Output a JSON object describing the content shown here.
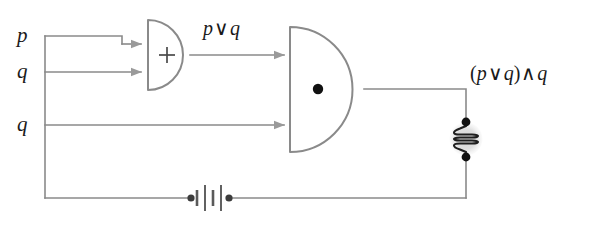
{
  "diagram": {
    "background_color": "#ffffff",
    "wire_color": "#8a8a8a",
    "gate_stroke_color": "#8a8a8a",
    "symbol_color": "#4a4a4a",
    "battery_color": "#5a5a5a",
    "lamp_halo_color": "#d8d8d8",
    "terminal_dot_color": "#111111",
    "text_color": "#1a1a1a"
  },
  "inputs": [
    {
      "id": "input-p",
      "label": "p",
      "y": 36
    },
    {
      "id": "input-q1",
      "label": "q",
      "y": 72
    },
    {
      "id": "input-q2",
      "label": "q",
      "y": 125
    }
  ],
  "gates": [
    {
      "id": "or-gate",
      "type": "OR",
      "symbol": "+",
      "symbol_name": "plus-symbol",
      "output_label": "p ∨ q"
    },
    {
      "id": "and-gate",
      "type": "AND",
      "symbol": "•",
      "symbol_name": "dot-symbol",
      "output_label": "(p ∨ q) ∧ q"
    }
  ],
  "labels": {
    "or_output": {
      "full": "p ∨ q",
      "left_operand": "p",
      "operator": "∨",
      "right_operand": "q"
    },
    "and_output": {
      "full": "(p ∨ q) ∧ q",
      "open_paren": "(",
      "inner_left": "p",
      "inner_operator": "∨",
      "inner_right": "q",
      "close_paren": ")",
      "outer_operator": "∧",
      "outer_right": "q"
    }
  },
  "components": [
    {
      "id": "lamp",
      "name": "lamp",
      "kind": "lamp-bulb",
      "x": 466,
      "y": 139,
      "coil_turns": 4
    },
    {
      "id": "battery",
      "name": "battery",
      "kind": "battery-cells",
      "x": 210,
      "y": 198,
      "cells": 2
    }
  ],
  "wires": {
    "bus_x": 45,
    "bottom_y": 198,
    "right_x": 466
  }
}
